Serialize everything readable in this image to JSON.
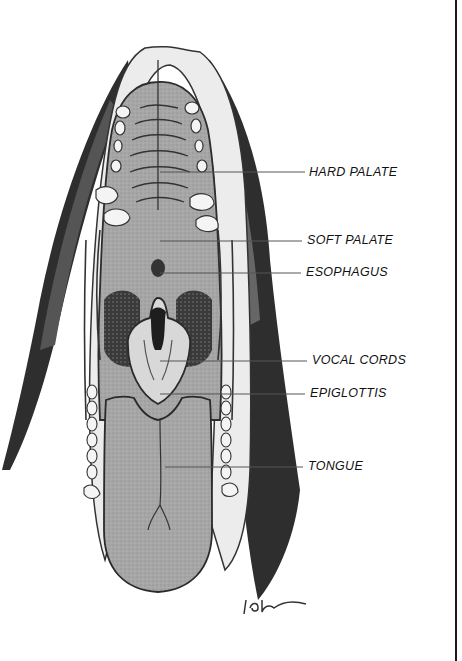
{
  "figure": {
    "style": "grayscale pencil illustration",
    "signature": "ldw"
  },
  "labels": [
    {
      "id": "hard-palate",
      "text": "HARD PALATE",
      "x": 309,
      "y": 195,
      "line_from_x": 160,
      "line_y": 172
    },
    {
      "id": "soft-palate",
      "text": "SOFT PALATE",
      "x": 307,
      "y": 233,
      "line_from_x": 160,
      "line_y": 241
    },
    {
      "id": "esophagus",
      "text": "ESOPHAGUS",
      "x": 306,
      "y": 266,
      "line_from_x": 160,
      "line_y": 273
    },
    {
      "id": "vocal-cords",
      "text": "VOCAL CORDS",
      "x": 312,
      "y": 354,
      "line_from_x": 160,
      "line_y": 361
    },
    {
      "id": "epiglottis",
      "text": "EPIGLOTTIS",
      "x": 310,
      "y": 387,
      "line_from_x": 160,
      "line_y": 394
    },
    {
      "id": "tongue",
      "text": "TONGUE",
      "x": 308,
      "y": 460,
      "line_from_x": 165,
      "line_y": 467
    }
  ],
  "colors": {
    "fur_dark": "#2a2a2a",
    "fur_light": "#e8e8e8",
    "tissue": "#a9a9a9",
    "tongue": "#9a9a9a",
    "outline": "#333333",
    "teeth": "#f2f2f2",
    "leader_line": "#555555"
  }
}
